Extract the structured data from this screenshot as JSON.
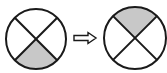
{
  "diagram": {
    "colors": {
      "stroke": "#1a1a1a",
      "shade": "#c8c8c8",
      "background": "#ffffff"
    },
    "left_circle": {
      "shaded_quadrant": "bottom"
    },
    "arrow": {
      "direction": "right",
      "style": "hollow"
    },
    "right_circle": {
      "shaded_quadrant": "top"
    }
  }
}
